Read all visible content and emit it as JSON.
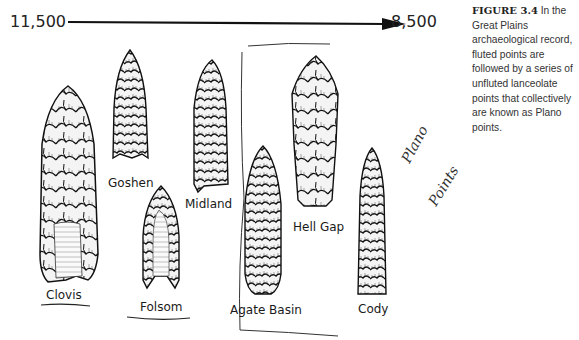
{
  "figure": {
    "timeline": {
      "start_label": "11,500",
      "end_label": "8,500",
      "direction": "left-to-right"
    },
    "caption": {
      "number": "FIGURE 3.4",
      "text": "In the Great Plains archaeological record, fluted points are followed by a series of unfluted lanceolate points that collectively are known as Plano points."
    },
    "points": [
      {
        "name": "Clovis",
        "underlined": true,
        "fluted": true
      },
      {
        "name": "Goshen",
        "underlined": false,
        "fluted": false
      },
      {
        "name": "Folsom",
        "underlined": true,
        "fluted": true
      },
      {
        "name": "Midland",
        "underlined": false,
        "fluted": false
      },
      {
        "name": "Agate Basin",
        "underlined": false,
        "fluted": false
      },
      {
        "name": "Hell Gap",
        "underlined": false,
        "fluted": false
      },
      {
        "name": "Cody",
        "underlined": false,
        "fluted": false
      }
    ],
    "handwritten_note": {
      "line1": "Plano",
      "line2": "Points"
    },
    "colors": {
      "ink": "#1a1a1a",
      "flake_fill": "#f2f2f2",
      "background": "#ffffff"
    }
  }
}
